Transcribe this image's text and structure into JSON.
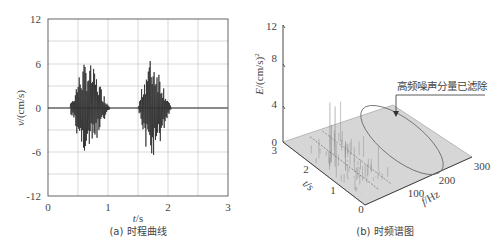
{
  "chart_data": [
    {
      "type": "line",
      "panel": "a",
      "caption": "(a) 时程曲线",
      "xlabel": "t/s",
      "ylabel": "v/(cm/s)",
      "xlim": [
        0,
        3
      ],
      "ylim": [
        -12,
        12
      ],
      "xticks": [
        "0",
        "1",
        "2",
        "3"
      ],
      "yticks": [
        "12",
        "6",
        "0",
        "-6",
        "-12"
      ],
      "grid": true,
      "description": "Blasting vibration velocity time history with two bursts",
      "bursts": [
        {
          "t_start": 0.37,
          "t_end": 1.45,
          "peak_pos": 9.0,
          "peak_neg": -7.0
        },
        {
          "t_start": 1.5,
          "t_end": 2.4,
          "peak_pos": 10.0,
          "peak_neg": -7.5
        }
      ]
    },
    {
      "type": "surface3d",
      "panel": "b",
      "caption": "(b) 时频谱图",
      "zlabel": "E/(cm/s)²",
      "ylabel": "t/s",
      "xlabel": "f/Hz",
      "zlim": [
        0,
        12
      ],
      "zticks": [
        "0",
        "4",
        "8",
        "12"
      ],
      "tticks": [
        "0",
        "1",
        "2",
        "3"
      ],
      "fticks": [
        "100",
        "200",
        "300"
      ],
      "annotation": "高频噪声分量已滤除",
      "description": "Time-frequency energy spectrum; energy concentrated below ~100 Hz, peak ~6.5 near t≈1.6s; high-frequency region circled as filtered"
    }
  ],
  "panel_a": {
    "caption": "(a) 时程曲线",
    "xlabel_italic": "t",
    "xlabel_unit": "/s",
    "ylabel_italic": "v",
    "ylabel_unit": "/(cm/s)",
    "yticks": [
      "12",
      "6",
      "0",
      "-6",
      "-12"
    ],
    "xticks": [
      "0",
      "1",
      "2",
      "3"
    ]
  },
  "panel_b": {
    "caption": "(b) 时频谱图",
    "zlabel_italic": "E",
    "zlabel_unit": "/(cm/s)",
    "zlabel_sup": "2",
    "zticks": [
      "12",
      "8",
      "4",
      "0"
    ],
    "tlabel": "t/s",
    "tticks": [
      "3",
      "2",
      "1",
      "0"
    ],
    "flabel_italic": "f",
    "flabel_unit": "/Hz",
    "fticks": [
      "100",
      "200",
      "300"
    ],
    "annotation": "高频噪声分量已滤除"
  }
}
